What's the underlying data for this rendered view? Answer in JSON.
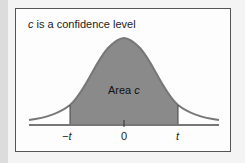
{
  "figure": {
    "title_var": "c",
    "title_rest": " is a confidence level",
    "area_label": "Area ",
    "area_var": "c",
    "ticks": [
      "−t",
      "0",
      "t"
    ],
    "colors": {
      "curve": "#777777",
      "shade": "#8a8a8a",
      "axis": "#777777",
      "frame": "#555555"
    }
  }
}
